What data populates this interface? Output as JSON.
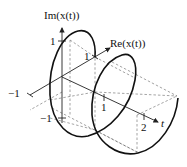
{
  "diagram": {
    "type": "3d-helix-plot",
    "axes": {
      "im": {
        "label": "Im(x(t))",
        "ticks": [
          "1",
          "−1"
        ]
      },
      "re": {
        "label": "Re(x(t))",
        "ticks": [
          "1",
          "−1"
        ]
      },
      "t": {
        "label": "t",
        "ticks": [
          "1",
          "2"
        ]
      }
    },
    "labels": {
      "im_axis": "Im(x(t))",
      "re_axis": "Re(x(t))",
      "t_axis": "t",
      "im_tick_pos": "1",
      "im_tick_neg": "−1",
      "re_tick_pos": "1",
      "re_tick_neg": "−1",
      "t_tick_1": "1",
      "t_tick_2": "2"
    }
  }
}
